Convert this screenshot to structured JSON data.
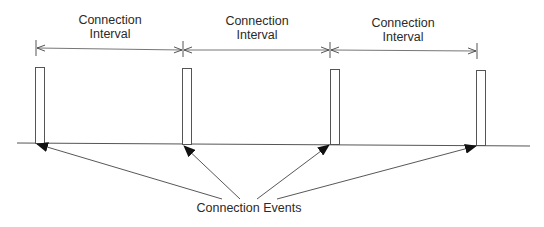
{
  "diagram": {
    "interval_labels": [
      {
        "line1": "Connection",
        "line2": "Interval"
      },
      {
        "line1": "Connection",
        "line2": "Interval"
      },
      {
        "line1": "Connection",
        "line2": "Interval"
      }
    ],
    "events_label": "Connection Events",
    "event_count": 4,
    "colors": {
      "stroke": "#3a3a3a",
      "text": "#2a2a2a",
      "background": "#ffffff"
    }
  }
}
